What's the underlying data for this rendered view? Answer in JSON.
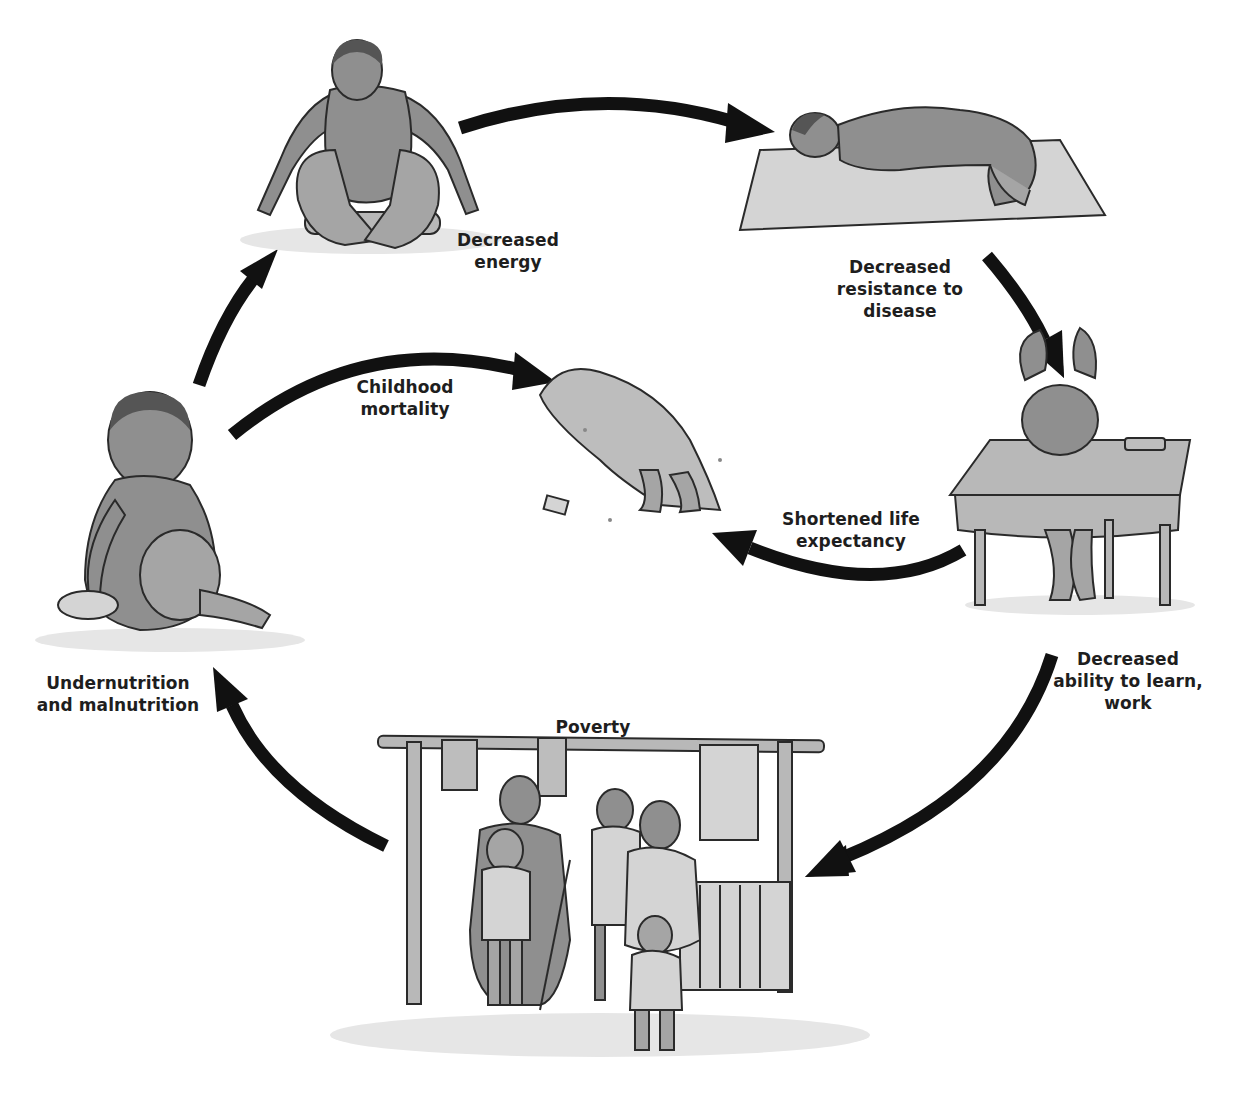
{
  "diagram": {
    "type": "cycle",
    "nodes": [
      {
        "id": "energy",
        "label_lines": [
          "Decreased",
          "energy"
        ],
        "illustration": "child squatting on log"
      },
      {
        "id": "resistance",
        "label_lines": [
          "Decreased",
          "resistance to",
          "disease"
        ],
        "illustration": "child lying ill on mat"
      },
      {
        "id": "learning",
        "label_lines": [
          "Decreased",
          "ability to learn,",
          "work"
        ],
        "illustration": "child slumped over school desk"
      },
      {
        "id": "poverty",
        "label_lines": [
          "Poverty"
        ],
        "illustration": "family under clothesline shelter"
      },
      {
        "id": "undernutrition",
        "label_lines": [
          "Undernutrition",
          "and malnutrition"
        ],
        "illustration": "malnourished child with bowl"
      },
      {
        "id": "mortality",
        "label_lines": [
          "Childhood",
          "mortality"
        ],
        "illustration": "covered body on ground"
      },
      {
        "id": "life_expectancy",
        "label_lines": [
          "Shortened life",
          "expectancy"
        ],
        "illustration": "none"
      }
    ],
    "edges": [
      {
        "from": "undernutrition",
        "to": "energy"
      },
      {
        "from": "energy",
        "to": "resistance"
      },
      {
        "from": "resistance",
        "to": "learning"
      },
      {
        "from": "learning",
        "to": "poverty"
      },
      {
        "from": "poverty",
        "to": "undernutrition"
      },
      {
        "from": "undernutrition",
        "to": "mortality",
        "label": "Childhood mortality"
      },
      {
        "from": "learning",
        "to": "mortality",
        "label": "Shortened life expectancy"
      }
    ],
    "colors": {
      "arrow": "#111111",
      "text": "#1e1e1e",
      "background": "#ffffff"
    }
  },
  "labels": {
    "energy": {
      "l1": "Decreased",
      "l2": "energy"
    },
    "resistance": {
      "l1": "Decreased",
      "l2": "resistance to",
      "l3": "disease"
    },
    "mortality": {
      "l1": "Childhood",
      "l2": "mortality"
    },
    "life_expectancy": {
      "l1": "Shortened life",
      "l2": "expectancy"
    },
    "learning": {
      "l1": "Decreased",
      "l2": "ability to learn,",
      "l3": "work"
    },
    "undernutrition": {
      "l1": "Undernutrition",
      "l2": "and malnutrition"
    },
    "poverty": {
      "l1": "Poverty"
    }
  }
}
